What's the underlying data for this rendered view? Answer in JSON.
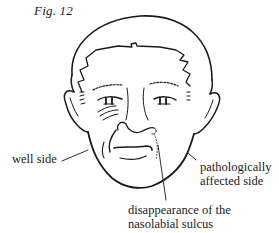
{
  "figure": {
    "label": "Fig. 12"
  },
  "annotations": {
    "well_side": "well side",
    "affected_side_line1": "pathologically",
    "affected_side_line2": "affected side",
    "sulcus_line1": "disappearance of the",
    "sulcus_line2": "nasolabial sulcus"
  },
  "colors": {
    "ink": "#1a1a1a",
    "background": "#ffffff"
  }
}
